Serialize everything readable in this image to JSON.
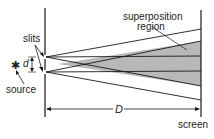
{
  "labels": {
    "superposition_line1": "superposition",
    "superposition_line2": "region",
    "slits": "slits",
    "d": "d",
    "source": "source",
    "D": "D",
    "screen": "screen",
    "source_symbol": "✱"
  },
  "colors": {
    "line": "#1a1a1a",
    "shade": "#b8b8b8",
    "background": "#ffffff"
  }
}
